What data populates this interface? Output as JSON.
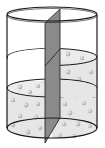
{
  "diagram": {
    "colors": {
      "background": "#ffffff",
      "outline": "#1a1a1a",
      "liquid": "#e6e6e6",
      "partition": "#8a8a8a",
      "particle": "#b4b4b4",
      "particle_highlight": "#e8e8e8"
    },
    "left_side": {
      "liquid_level": "low",
      "particles": true
    },
    "right_side": {
      "liquid_level": "high",
      "particles": true
    }
  }
}
